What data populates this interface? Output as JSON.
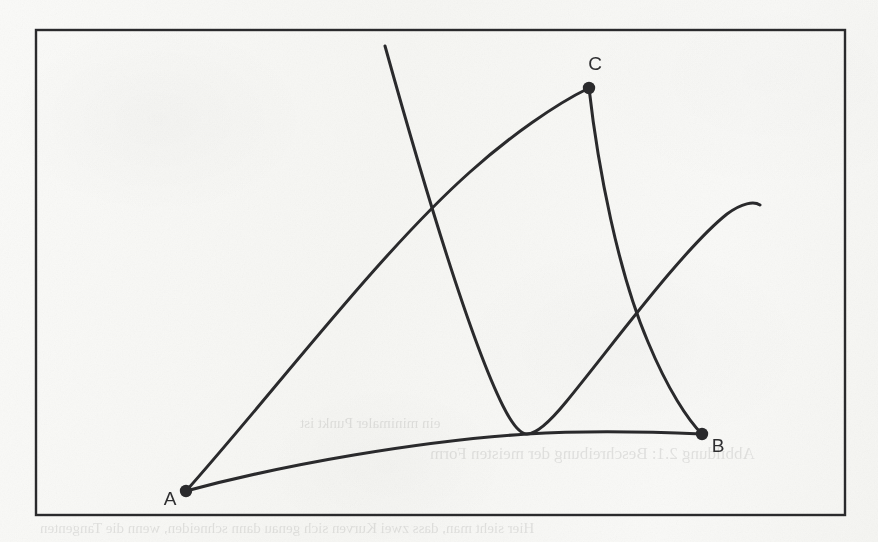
{
  "figure": {
    "kind": "hand-drawn mathematical diagram on scanned paper",
    "background_color": "#f8f8f6",
    "ink_color": "#2a2a2c",
    "frame": {
      "name": "figure-border-box",
      "x": 36,
      "y": 30,
      "width": 809,
      "height": 485,
      "stroke_width": 2.4,
      "color": "#2a2a2c"
    },
    "points": [
      {
        "id": "A",
        "label": "A",
        "x": 186,
        "y": 491,
        "radius": 6.2,
        "label_x": 170,
        "label_y": 505,
        "label_anchor": "middle"
      },
      {
        "id": "B",
        "label": "B",
        "x": 702,
        "y": 434,
        "radius": 6.2,
        "label_x": 718,
        "label_y": 452,
        "label_anchor": "middle"
      },
      {
        "id": "C",
        "label": "C",
        "x": 589,
        "y": 88,
        "radius": 6.2,
        "label_x": 595,
        "label_y": 70,
        "label_anchor": "middle"
      }
    ],
    "curves": [
      {
        "id": "curve-A-to-C",
        "name": "upper-arc-A-C",
        "description": "concave-down arc rising from point A to point C",
        "from": "A",
        "to": "C",
        "path": "M 186 491 C 274 392, 380 252, 470 172 C 510 136, 556 104, 589 88",
        "stroke_width": 3.0
      },
      {
        "id": "curve-A-to-B",
        "name": "lower-arc-A-B",
        "description": "shallow concave-down arc from point A to point B, tangent to the parabola minimum",
        "from": "A",
        "to": "B",
        "path": "M 186 491 C 286 464, 420 441, 527 434 C 590 430, 658 432, 702 434",
        "stroke_width": 3.0
      },
      {
        "id": "curve-C-to-B",
        "name": "descending-arc-C-B",
        "description": "curve descending from point C down to point B",
        "from": "C",
        "to": "B",
        "path": "M 589 88 C 598 168, 618 272, 648 342 C 668 390, 688 420, 702 434",
        "stroke_width": 3.0
      },
      {
        "id": "curve-parabola",
        "name": "parabola-through-tangent-point",
        "description": "steep parabola entering at the top edge, descending to a minimum tangent to arc A-B at (527,434), then rising to the right and ending short of the right border",
        "enters_at": {
          "x": 385,
          "y": 46
        },
        "minimum": {
          "x": 527,
          "y": 434
        },
        "ends_at": {
          "x": 760,
          "y": 205
        },
        "path": "M 385 46 C 424 186, 470 340, 503 406 C 514 428, 521 434, 527 434 C 536 434, 548 424, 566 402 C 612 346, 682 250, 727 214 C 742 203, 754 201, 760 205",
        "stroke_width": 3.0
      }
    ],
    "intersections": [
      {
        "name": "parabola-crosses-arc-AC",
        "x": 418,
        "y": 201
      },
      {
        "name": "parabola-crosses-arc-CB",
        "x": 645,
        "y": 315
      }
    ],
    "bleed_through_text": [
      {
        "name": "bleed-line-caption",
        "text": "Abbildung 2.1: Beschreibung der meisten Form",
        "x": 430,
        "y": 455,
        "size": 17
      },
      {
        "name": "bleed-line-body-1",
        "text": "Hier sieht man, dass zwei Kurven sich genau dann schneiden, wenn die Tangenten",
        "x": 40,
        "y": 530,
        "size": 15
      },
      {
        "name": "bleed-line-body-2",
        "text": "ein minimaler Punkt ist",
        "x": 300,
        "y": 425,
        "size": 15
      }
    ]
  }
}
